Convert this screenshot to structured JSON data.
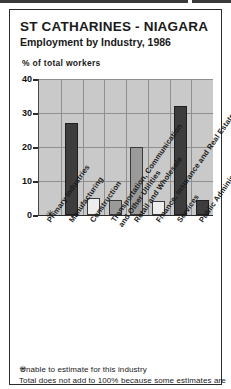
{
  "header": {
    "title": "ST CATHARINES - NIAGARA",
    "subtitle": "Employment by Industry, 1986"
  },
  "chart_data": {
    "type": "bar",
    "title": "ST CATHARINES - NIAGARA",
    "subtitle": "Employment by Industry, 1986",
    "ylabel": "% of total workers",
    "xlabel": "",
    "ylim": [
      0,
      40
    ],
    "yticks": [
      0,
      10,
      20,
      30,
      40
    ],
    "ytick_labels": [
      "0",
      "10",
      "20",
      "30",
      "40"
    ],
    "grid": true,
    "legend": "none",
    "categories": [
      "Primary Industries",
      "Manufacturing",
      "Construction",
      "Transportation, Communication and Other Utilities",
      "Retail and Wholesale",
      "Finance, Insurance and Real Estate",
      "Services",
      "Public Administration"
    ],
    "category_lines": [
      [
        "Primary Industries"
      ],
      [
        "Manufacturing"
      ],
      [
        "Construction"
      ],
      [
        "Transportation, Communication",
        "and Other Utilities"
      ],
      [
        "Retail and Wholesale"
      ],
      [
        "Finance, Insurance and Real Estate"
      ],
      [
        "Services"
      ],
      [
        "Public Administration"
      ]
    ],
    "values": [
      null,
      27,
      5,
      4.5,
      20,
      4,
      32,
      4.5
    ],
    "value_labels": [
      "*",
      "27",
      "5",
      "4.5",
      "20",
      "4",
      "32",
      "4.5"
    ],
    "bar_styles": [
      "none",
      "dark",
      "light",
      "mid",
      "mid",
      "light",
      "dark",
      "dark"
    ],
    "no_data_marker": "✳",
    "no_data_category": "Primary Industries",
    "colors": {
      "plot_background": "#c9c9c9",
      "gridline": "#8f8f8f",
      "bar_dark": "#3d3d3d",
      "bar_mid": "#9a9a9a",
      "bar_light": "#ededed",
      "axis": "#2b2b2b",
      "text": "#1a1a1a",
      "page_background": "#ffffff"
    }
  },
  "footnotes": {
    "marker": "✳",
    "line1": "Unable to estimate for this industry",
    "line2": "Total does not add to 100% because some estimates are"
  }
}
